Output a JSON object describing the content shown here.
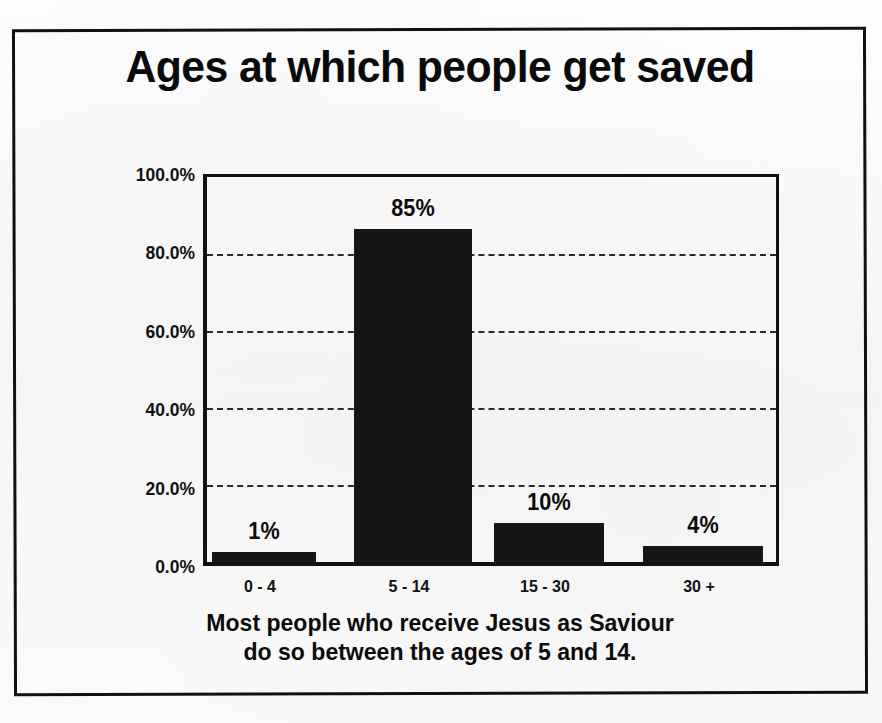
{
  "chart_data": {
    "type": "bar",
    "title": "Ages at which people get saved",
    "categories": [
      "0 - 4",
      "5 - 14",
      "15 - 30",
      "30 +"
    ],
    "values": [
      1,
      85,
      10,
      4
    ],
    "data_labels": [
      "1%",
      "85%",
      "10%",
      "4%"
    ],
    "xlabel": "",
    "ylabel": "",
    "ylim": [
      0,
      100
    ],
    "ytick_labels": [
      "100.0%",
      "80.0%",
      "60.0%",
      "40.0%",
      "20.0%",
      "0.0%"
    ],
    "ytick_values": [
      100,
      80,
      60,
      40,
      20,
      0
    ],
    "grid": "horizontal-dashed",
    "legend": "none",
    "bar_color": "#151515",
    "units": "percent"
  },
  "caption": {
    "line1": "Most people who receive Jesus as Saviour",
    "line2": "do so between the ages of 5 and 14."
  },
  "colors": {
    "bar": "#151515",
    "axis": "#111111",
    "grid": "#2b2b2b",
    "text": "#0b0b0b",
    "background": "#fbfbfb",
    "frame": "#111111"
  }
}
